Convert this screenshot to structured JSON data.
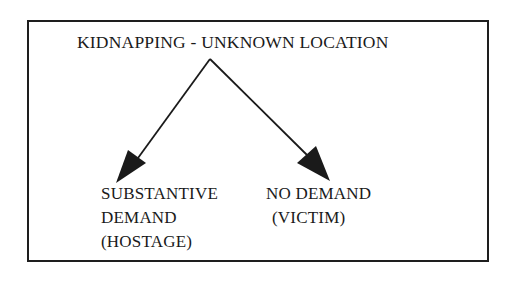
{
  "diagram": {
    "title": "KIDNAPPING - UNKNOWN LOCATION",
    "branches": [
      {
        "lines": [
          "SUBSTANTIVE",
          "DEMAND",
          "(HOSTAGE)"
        ]
      },
      {
        "lines": [
          "NO DEMAND",
          "(VICTIM)"
        ]
      }
    ]
  },
  "colors": {
    "ink": "#1a1a1a",
    "background": "#ffffff"
  }
}
